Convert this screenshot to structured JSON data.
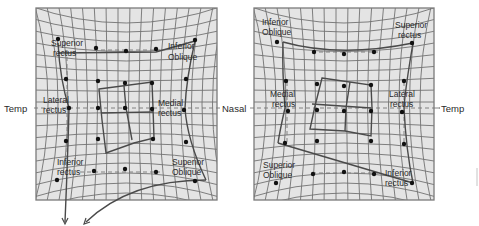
{
  "diagram": {
    "type": "Hess chart (paired ocular motility grids)",
    "colors": {
      "grid_bg": "#e4e4e4",
      "grid_line": "#6e6e6e",
      "frame": "#7a7a7a",
      "plot_line": "#4a4a4a",
      "dot": "#111111",
      "text": "#2a2a2a"
    },
    "left_panel": {
      "side_labels": {
        "left": "Temp",
        "right": "Nasal"
      },
      "muscle_labels": {
        "top_left": [
          "Superior",
          "rectus"
        ],
        "top_right": [
          "Inferior",
          "Oblique"
        ],
        "mid_left": [
          "Lateral",
          "rectus"
        ],
        "mid_right": [
          "Medial",
          "rectus"
        ],
        "bottom_left": [
          "Inferior",
          "rectus"
        ],
        "bottom_right": [
          "Superior",
          "Oblique"
        ]
      }
    },
    "right_panel": {
      "side_labels": {
        "left": "Nasal",
        "right": "Temp"
      },
      "muscle_labels": {
        "top_left": [
          "Inferior",
          "Oblique"
        ],
        "top_right": [
          "Superior",
          "rectus"
        ],
        "mid_left": [
          "Medial",
          "rectus"
        ],
        "mid_right": [
          "Lateral",
          "rectus"
        ],
        "bottom_left": [
          "Superior",
          "Oblique"
        ],
        "bottom_right": [
          "Inferior",
          "rectus"
        ]
      }
    }
  }
}
